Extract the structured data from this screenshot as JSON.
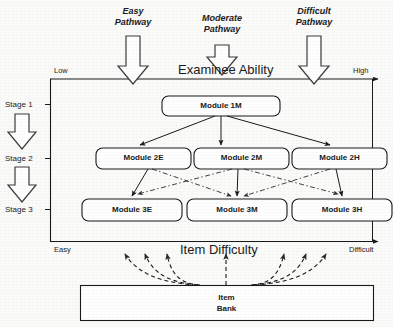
{
  "figure": {
    "pathways": [
      {
        "id": "easy",
        "line1": "Easy",
        "line2": "Pathway"
      },
      {
        "id": "moderate",
        "line1": "Moderate",
        "line2": "Pathway"
      },
      {
        "id": "difficult",
        "line1": "Difficult",
        "line2": "Pathway"
      }
    ],
    "ability_axis": {
      "title": "Examinee Ability",
      "low": "Low",
      "high": "High"
    },
    "difficulty_axis": {
      "title": "Item Difficulty",
      "easy": "Easy",
      "difficult": "Difficult"
    },
    "stages": [
      {
        "id": "stage1",
        "label": "Stage 1"
      },
      {
        "id": "stage2",
        "label": "Stage 2"
      },
      {
        "id": "stage3",
        "label": "Stage 3"
      }
    ],
    "modules": {
      "stage1": [
        {
          "id": "module-1m",
          "label": "Module 1M"
        }
      ],
      "stage2": [
        {
          "id": "module-2e",
          "label": "Module 2E"
        },
        {
          "id": "module-2m",
          "label": "Module 2M"
        },
        {
          "id": "module-2h",
          "label": "Module 2H"
        }
      ],
      "stage3": [
        {
          "id": "module-3e",
          "label": "Module 3E"
        },
        {
          "id": "module-3m",
          "label": "Module 3M"
        },
        {
          "id": "module-3h",
          "label": "Module 3H"
        }
      ]
    },
    "item_bank": {
      "line1": "Item",
      "line2": "Bank"
    },
    "colors": {
      "stroke": "#1a1a1a",
      "fill": "#ffffff",
      "background": "#fbfbfa",
      "dashed": "#3a3a3a"
    }
  }
}
